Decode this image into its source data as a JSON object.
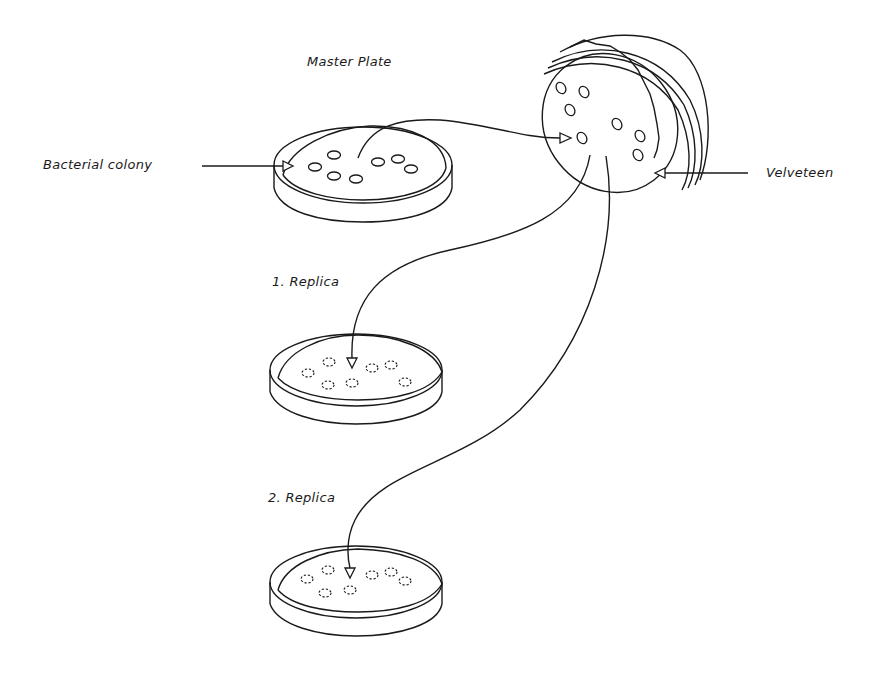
{
  "diagram": {
    "type": "replica-plating",
    "labels": {
      "master_plate": "Master Plate",
      "bacterial_colony": "Bacterial colony",
      "velveteen": "Velveteen",
      "replica_1": "1. Replica",
      "replica_2": "2. Replica"
    },
    "nodes": [
      {
        "id": "master_plate",
        "label": "Master Plate",
        "colonies": 8,
        "colony_style": "solid"
      },
      {
        "id": "velveteen_stamp",
        "label": "Velveteen",
        "colonies": 8,
        "colony_style": "solid"
      },
      {
        "id": "replica_1",
        "label": "1. Replica",
        "colonies": 8,
        "colony_style": "dashed"
      },
      {
        "id": "replica_2",
        "label": "2. Replica",
        "colonies": 8,
        "colony_style": "dashed"
      }
    ],
    "edges": [
      {
        "from": "master_plate",
        "to": "velveteen_stamp"
      },
      {
        "from": "velveteen_stamp",
        "to": "replica_1"
      },
      {
        "from": "velveteen_stamp",
        "to": "replica_2"
      }
    ],
    "pointers": [
      {
        "label": "Bacterial colony",
        "target": "master_plate"
      },
      {
        "label": "Velveteen",
        "target": "velveteen_stamp"
      }
    ]
  }
}
